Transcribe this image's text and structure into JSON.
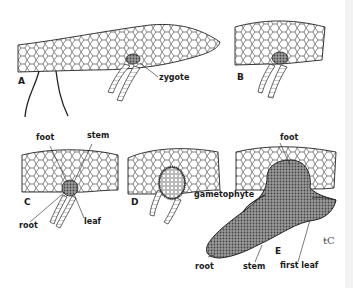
{
  "figure": {
    "panels": [
      {
        "id": "A",
        "letter": "A",
        "labels": [
          "zygote"
        ]
      },
      {
        "id": "B",
        "letter": "B",
        "labels": []
      },
      {
        "id": "C",
        "letter": "C",
        "labels": [
          "foot",
          "stem",
          "root",
          "leaf"
        ]
      },
      {
        "id": "D",
        "letter": "D",
        "labels": [
          "gametophyte"
        ]
      },
      {
        "id": "E",
        "letter": "E",
        "labels": [
          "foot",
          "root",
          "stem",
          "first leaf"
        ]
      }
    ],
    "signature": "℃",
    "colors": {
      "ink": "#1a1a1a",
      "background": "#ffffff",
      "edge_strip": "#f2f2f2"
    }
  },
  "labels": {
    "a_letter": "A",
    "a_zygote": "zygote",
    "b_letter": "B",
    "c_letter": "C",
    "c_foot": "foot",
    "c_stem": "stem",
    "c_root": "root",
    "c_leaf": "leaf",
    "d_letter": "D",
    "d_gametophyte": "gametophyte",
    "e_letter": "E",
    "e_foot": "foot",
    "e_root": "root",
    "e_stem": "stem",
    "e_first_leaf": "first leaf",
    "signature": "ŧC"
  }
}
